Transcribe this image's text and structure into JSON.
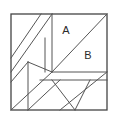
{
  "figure": {
    "type": "geometric-dissection-puzzle",
    "background_color": "#ffffff",
    "stroke_color": "#555555",
    "border_color": "#444444",
    "label_color": "#2b2b2b",
    "canvas": {
      "width": 116,
      "height": 121
    },
    "square": {
      "x": 11,
      "y": 14,
      "width": 96,
      "height": 96
    },
    "labels": [
      {
        "id": "A",
        "text": "A",
        "x": 66,
        "y": 31
      },
      {
        "id": "B",
        "text": "B",
        "x": 88,
        "y": 56
      }
    ],
    "segments": [
      {
        "name": "main-diagonal",
        "x1": 52,
        "y1": 72,
        "x2": 107,
        "y2": 14
      },
      {
        "name": "upper-left-diagonal-outer",
        "x1": 11,
        "y1": 72,
        "x2": 52,
        "y2": 14
      },
      {
        "name": "upper-left-diagonal-inner",
        "x1": 11,
        "y1": 58,
        "x2": 41,
        "y2": 14
      },
      {
        "name": "upper-vertical-long",
        "x1": 52,
        "y1": 14,
        "x2": 52,
        "y2": 72
      },
      {
        "name": "upper-vertical-short",
        "x1": 45,
        "y1": 38,
        "x2": 45,
        "y2": 72
      },
      {
        "name": "mid-left-vertex-diagonal",
        "x1": 28,
        "y1": 62,
        "x2": 52,
        "y2": 72
      },
      {
        "name": "left-vertical",
        "x1": 28,
        "y1": 62,
        "x2": 28,
        "y2": 110
      },
      {
        "name": "left-lower-diagonal",
        "x1": 11,
        "y1": 82,
        "x2": 28,
        "y2": 62
      },
      {
        "name": "lower-left-long-diagonal",
        "x1": 11,
        "y1": 110,
        "x2": 52,
        "y2": 72
      },
      {
        "name": "bottom-diagonal-to-edge",
        "x1": 28,
        "y1": 110,
        "x2": 60,
        "y2": 80
      },
      {
        "name": "mid-horizontal-upper",
        "x1": 52,
        "y1": 72,
        "x2": 107,
        "y2": 72
      },
      {
        "name": "mid-horizontal-lower",
        "x1": 40,
        "y1": 80,
        "x2": 107,
        "y2": 80
      },
      {
        "name": "right-lower-diagonal",
        "x1": 60,
        "y1": 110,
        "x2": 107,
        "y2": 72
      },
      {
        "name": "down-triangle-left-edge",
        "x1": 52,
        "y1": 80,
        "x2": 75,
        "y2": 110
      },
      {
        "name": "down-triangle-right-edge",
        "x1": 75,
        "y1": 110,
        "x2": 90,
        "y2": 80
      }
    ]
  }
}
